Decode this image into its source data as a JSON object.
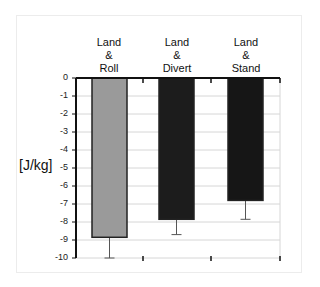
{
  "chart_data": {
    "type": "bar",
    "title": "",
    "categories": [
      "Land & Roll",
      "Land & Divert",
      "Land & Stand"
    ],
    "category_lines": [
      [
        "Land",
        "&",
        "Roll"
      ],
      [
        "Land",
        "&",
        "Divert"
      ],
      [
        "Land",
        "&",
        "Stand"
      ]
    ],
    "values": [
      -8.85,
      -7.85,
      -6.8
    ],
    "error_bars": [
      -10.0,
      -8.7,
      -7.85
    ],
    "bar_colors": [
      "#9a9a9a",
      "#1c1c1c",
      "#161616"
    ],
    "xlabel": "",
    "ylabel": "[J/kg]",
    "ylim": [
      -10,
      0
    ],
    "yticks": [
      "0",
      "-1",
      "-2",
      "-3",
      "-4",
      "-5",
      "-6",
      "-7",
      "-8",
      "-9",
      "-10"
    ],
    "grid": true,
    "category_axis_position": "top",
    "legend": null
  }
}
